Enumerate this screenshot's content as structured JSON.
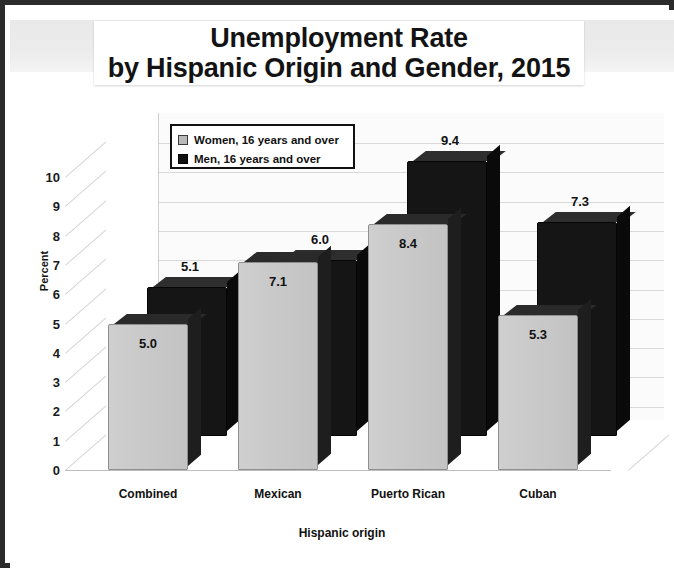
{
  "title": {
    "line1": "Unemployment Rate",
    "line2": "by Hispanic Origin and Gender, 2015",
    "ghost": "Unemployment Rate"
  },
  "legend": {
    "items": [
      {
        "label": "Women, 16 years and over",
        "swatch": "#b9b9b9"
      },
      {
        "label": "Men, 16 years and over",
        "swatch": "#101010"
      }
    ]
  },
  "axes": {
    "ylabel": "Percent",
    "xlabel": "Hispanic origin",
    "yticks": [
      "10",
      "9",
      "8",
      "7",
      "6",
      "5",
      "4",
      "3",
      "2",
      "1",
      "0"
    ],
    "xticks": [
      "Combined",
      "Mexican",
      "Puerto Rican",
      "Cuban"
    ]
  },
  "chart_data": {
    "type": "bar",
    "title": "Unemployment Rate by Hispanic Origin and Gender, 2015",
    "xlabel": "Hispanic origin",
    "ylabel": "Percent",
    "ylim": [
      0,
      10
    ],
    "ytick_step": 1,
    "grid": true,
    "legend_position": "upper-left-inside",
    "three_d": true,
    "categories": [
      "Combined",
      "Mexican",
      "Puerto Rican",
      "Cuban"
    ],
    "series": [
      {
        "name": "Women, 16 years and over",
        "color": "#c9c9c9",
        "values": [
          5.0,
          7.1,
          8.4,
          5.3
        ],
        "labels": [
          "5.0",
          "7.1",
          "8.4",
          "5.3"
        ]
      },
      {
        "name": "Men, 16 years and over",
        "color": "#151515",
        "values": [
          5.1,
          6.0,
          9.4,
          7.3
        ],
        "labels": [
          "5.1",
          "6.0",
          "9.4",
          "7.3"
        ]
      }
    ]
  },
  "colors": {
    "frame": "#2b2b2b",
    "women_bar": "#c9c9c9",
    "men_bar": "#151515",
    "grid": "#d8d8d8",
    "plot_bg": "#fbfbfb"
  }
}
